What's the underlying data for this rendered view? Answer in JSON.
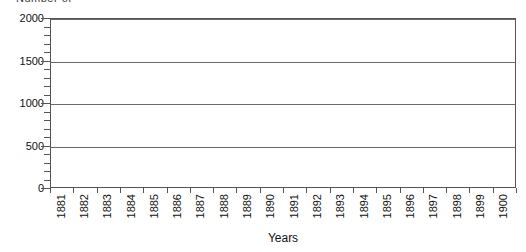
{
  "chart_data": {
    "type": "bar",
    "title": "",
    "clipped_top_text": "Number of",
    "xlabel": "Years",
    "ylabel": "",
    "categories": [
      "1881",
      "1882",
      "1883",
      "1884",
      "1885",
      "1886",
      "1887",
      "1888",
      "1889",
      "1890",
      "1891",
      "1892",
      "1893",
      "1894",
      "1895",
      "1896",
      "1897",
      "1898",
      "1899",
      "1900"
    ],
    "values": [
      0,
      0,
      0,
      0,
      0,
      0,
      0,
      0,
      0,
      0,
      0,
      0,
      0,
      0,
      0,
      0,
      0,
      0,
      0,
      0
    ],
    "series": [
      {
        "name": "",
        "values": [
          0,
          0,
          0,
          0,
          0,
          0,
          0,
          0,
          0,
          0,
          0,
          0,
          0,
          0,
          0,
          0,
          0,
          0,
          0,
          0
        ]
      }
    ],
    "ylim": [
      0,
      2000
    ],
    "y_major_ticks": [
      0,
      500,
      1000,
      1500,
      2000
    ],
    "y_major_labels": [
      "0",
      "500",
      "1000",
      "1500",
      "2000"
    ],
    "y_minor_interval": 100,
    "gridlines": [
      500,
      1000,
      1500,
      2000
    ],
    "grid": true,
    "legend": "none",
    "colors": {
      "background": "#ffffff",
      "plot_background": "#ffffff",
      "gridline": "#6a6a6a",
      "axis": "#555555",
      "text": "#111111"
    }
  }
}
